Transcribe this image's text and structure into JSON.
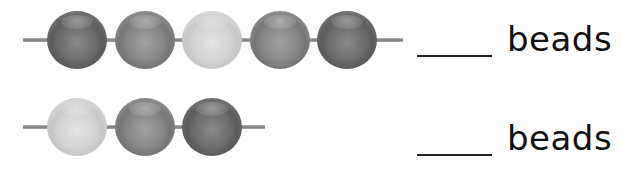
{
  "rows": [
    {
      "beads": [
        "dark",
        "medium",
        "light",
        "medium",
        "dark"
      ],
      "answer_blank": "",
      "label": "beads"
    },
    {
      "beads": [
        "light",
        "medium",
        "dark"
      ],
      "answer_blank": "",
      "label": "beads"
    }
  ],
  "colors": {
    "dark_bead": "#4a4a4a",
    "medium_bead": "#7a7a7a",
    "light_bead": "#d2d2d2",
    "wire": "#8a8a8a",
    "text": "#111111"
  }
}
